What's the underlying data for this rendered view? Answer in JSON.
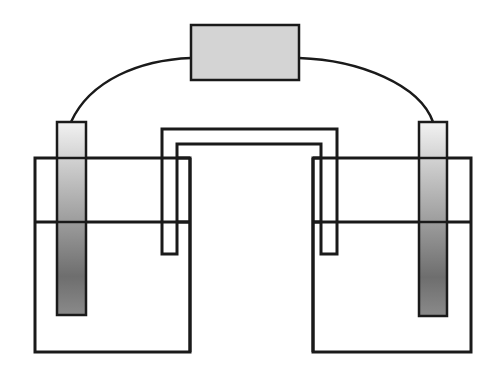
{
  "diagram": {
    "type": "electrochemical-cell",
    "labels": [],
    "components": {
      "meter": {
        "x": 191,
        "y": 25,
        "w": 108,
        "h": 55,
        "fill": "#d4d4d4"
      },
      "left_beaker": {
        "x": 35,
        "y": 158,
        "w": 155,
        "h": 194,
        "liquid_level_y": 222
      },
      "right_beaker": {
        "x": 313,
        "y": 158,
        "w": 158,
        "h": 194,
        "liquid_level_y": 222
      },
      "left_electrode": {
        "x": 57,
        "y": 122,
        "w": 29,
        "h": 193
      },
      "right_electrode": {
        "x": 419,
        "y": 122,
        "w": 28,
        "h": 194
      },
      "salt_bridge": {
        "outer_left_x": 162,
        "inner_left_x": 177,
        "inner_right_x": 321,
        "outer_right_x": 337,
        "outer_top_y": 129,
        "inner_top_y": 144,
        "bottom_y": 254
      }
    },
    "colors": {
      "stroke": "#1a1a1a",
      "meter_fill": "#d4d4d4",
      "electrode_light": "#eeeeee",
      "electrode_dark": "#6e6e6e"
    }
  }
}
